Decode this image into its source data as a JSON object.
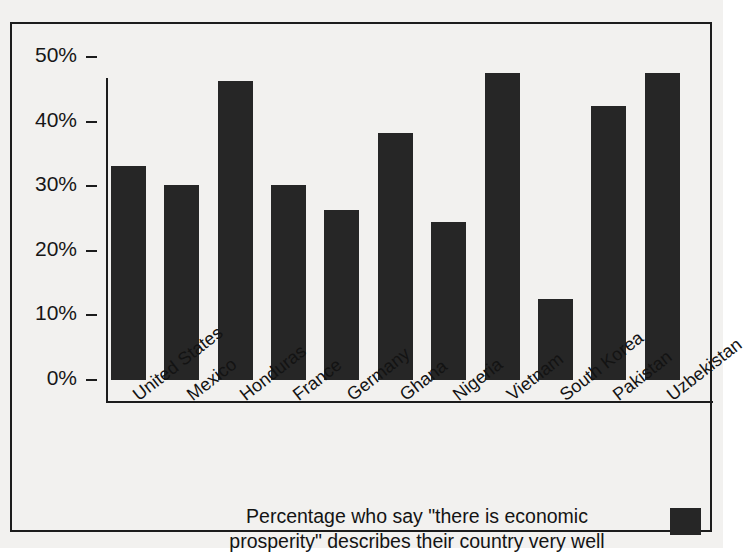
{
  "chart_data": {
    "type": "bar",
    "title": "",
    "subtitle": "",
    "xlabel": "",
    "ylabel": "",
    "ylim": [
      0,
      50
    ],
    "yticks": [
      0,
      10,
      20,
      30,
      40,
      50
    ],
    "ytick_labels": [
      "0%",
      "10%",
      "20%",
      "30%",
      "40%",
      "50%"
    ],
    "grid": false,
    "legend_position": "bottom",
    "series_name": "Percentage who say \"there is economic prosperity\" describes their country very well",
    "categories": [
      "United States",
      "Mexico",
      "Honduras",
      "France",
      "Germany",
      "Ghana",
      "Nigeria",
      "Vietnam",
      "South Korea",
      "Pakistan",
      "Uzbekistan"
    ],
    "values": [
      33.2,
      30.2,
      46.3,
      30.2,
      26.3,
      38.3,
      24.4,
      47.5,
      12.5,
      42.4,
      47.5
    ],
    "bar_color": "#262626",
    "background_color": "#f2f1ef",
    "axis_color": "#1c1c1c"
  },
  "legend": {
    "line1": "Percentage who say \"there is economic",
    "line2": "prosperity\" describes their country very well",
    "swatch_color": "#262626"
  }
}
